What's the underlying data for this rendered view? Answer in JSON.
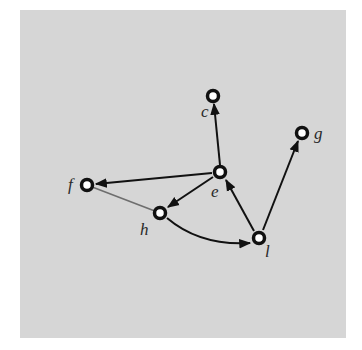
{
  "diagram": {
    "type": "directed-graph",
    "background_color": "#d6d6d6",
    "edge_color": "#111111",
    "undirected_edge_color": "#6e6e6e",
    "nodes": [
      {
        "id": "c",
        "label": "c",
        "x": 213,
        "y": 96,
        "label_x": 201,
        "label_y": 117
      },
      {
        "id": "g",
        "label": "g",
        "x": 302,
        "y": 133,
        "label_x": 314,
        "label_y": 139
      },
      {
        "id": "e",
        "label": "e",
        "x": 220,
        "y": 172,
        "label_x": 211,
        "label_y": 197
      },
      {
        "id": "f",
        "label": "f",
        "x": 87,
        "y": 185,
        "label_x": 68,
        "label_y": 190
      },
      {
        "id": "h",
        "label": "h",
        "x": 160,
        "y": 213,
        "label_x": 140,
        "label_y": 235
      },
      {
        "id": "l",
        "label": "l",
        "x": 259,
        "y": 238,
        "label_x": 265,
        "label_y": 257
      }
    ],
    "edges": [
      {
        "from": "e",
        "to": "c",
        "directed": true
      },
      {
        "from": "e",
        "to": "f",
        "directed": true
      },
      {
        "from": "e",
        "to": "h",
        "directed": true
      },
      {
        "from": "h",
        "to": "l",
        "directed": true,
        "curved": true
      },
      {
        "from": "l",
        "to": "e",
        "directed": true
      },
      {
        "from": "l",
        "to": "g",
        "directed": true
      },
      {
        "from": "f",
        "to": "h",
        "directed": false,
        "color": "gray"
      }
    ]
  }
}
